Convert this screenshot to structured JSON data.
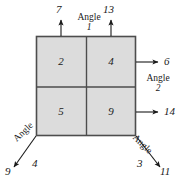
{
  "figure": {
    "block": {
      "fill_color": "#dcdcdc",
      "stroke_color": "#4d4d4d",
      "cells": [
        {
          "id": "cell-top-left",
          "label": "2"
        },
        {
          "id": "cell-top-right",
          "label": "4"
        },
        {
          "id": "cell-bottom-left",
          "label": "5"
        },
        {
          "id": "cell-bottom-right",
          "label": "9"
        }
      ]
    },
    "arrows": [
      {
        "id": "arrow-top-left",
        "label": "7",
        "direction": "up"
      },
      {
        "id": "arrow-top-right",
        "label": "13",
        "direction": "up"
      },
      {
        "id": "arrow-right-upper",
        "label": "6",
        "direction": "right"
      },
      {
        "id": "arrow-right-lower",
        "label": "14",
        "direction": "right"
      },
      {
        "id": "arrow-bottom-left",
        "label": "9",
        "direction": "down-left"
      },
      {
        "id": "arrow-bottom-right",
        "label": "11",
        "direction": "down-right"
      }
    ],
    "angles": [
      {
        "id": "angle-1",
        "word": "Angle",
        "number": "1",
        "position": "top-center"
      },
      {
        "id": "angle-2",
        "word": "Angle",
        "number": "2",
        "position": "right-middle"
      },
      {
        "id": "angle-3",
        "word": "Angle",
        "number": "3",
        "position": "bottom-right"
      },
      {
        "id": "angle-4",
        "word": "Angle",
        "number": "4",
        "position": "bottom-left"
      }
    ]
  }
}
